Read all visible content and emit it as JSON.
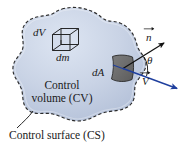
{
  "figure": {
    "type": "physics-diagram",
    "canvas": {
      "width": 183,
      "height": 155,
      "background": "#ffffff"
    },
    "colors": {
      "control_volume_fill": "#c3cee2",
      "control_volume_fill_light": "#dde4f0",
      "control_volume_outline": "#2b2b2b",
      "patch_fill": "#6f6f6f",
      "patch_outline": "#2b2b2b",
      "normal_vector": "#111111",
      "velocity_vector": "#1f3f9e",
      "text": "#1a1a1a",
      "leader_line": "#1a1a1a"
    },
    "labels": {
      "differential_volume": "dV",
      "differential_mass": "dm",
      "differential_area": "dA",
      "normal_vector": "n",
      "angle": "θ",
      "velocity_vector": "V",
      "control_volume_line1": "Control",
      "control_volume_line2": "volume (CV)",
      "control_surface": "Control surface (CS)"
    },
    "elements": {
      "control_volume_blob": {
        "name": "control volume",
        "boundary_style": "dashed",
        "fill": "#c3cee2"
      },
      "cube": {
        "name": "differential volume element",
        "style": "wireframe-3d-cube"
      },
      "area_patch": {
        "name": "differential area element on control surface",
        "fill": "#6f6f6f"
      },
      "vectors": [
        {
          "name": "outward unit normal",
          "symbol": "n",
          "color": "#111111",
          "direction": "up-right"
        },
        {
          "name": "velocity",
          "symbol": "V",
          "color": "#1f3f9e",
          "direction": "down-right"
        }
      ],
      "angle_arc": {
        "name": "angle between normal and velocity",
        "symbol": "θ"
      },
      "leader_line": {
        "name": "control surface callout leader",
        "from": "Control surface (CS)",
        "to": "control volume boundary"
      }
    }
  }
}
